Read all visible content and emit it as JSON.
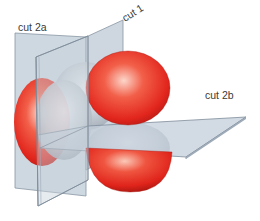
{
  "diagram": {
    "labels": {
      "cut_2a": "cut 2a",
      "cut_1": "cut 1",
      "cut_2b": "cut 2b"
    },
    "colors": {
      "plane_fill": "#b9c6d2",
      "plane_edge": "#7f8d9a",
      "lobe_red": "#e2261d",
      "lobe_red_highlight": "#fbd3c6",
      "lobe_gray": "#b7bec6",
      "lobe_gray_highlight": "#eef1f4"
    },
    "elements": {
      "planes": [
        "cut 2a (vertical back plane)",
        "cut 1 (vertical plane)",
        "cut 2b (horizontal plane)"
      ],
      "lobes": [
        "red lobe upper right",
        "red lobe lower right",
        "red lobe left",
        "gray lobe upper back",
        "gray lobe lower",
        "gray lobe left front"
      ]
    }
  }
}
